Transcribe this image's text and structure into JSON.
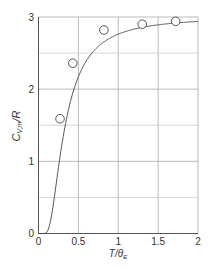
{
  "chart_data": {
    "type": "line",
    "title": "",
    "xlabel": "T/θE",
    "ylabel": "C_{V,m}/R",
    "xlim": [
      0,
      2
    ],
    "ylim": [
      0,
      3
    ],
    "x_ticks": [
      0,
      0.5,
      1,
      1.5,
      2
    ],
    "x_tick_labels": [
      "0",
      "0.5",
      "1",
      "1.5",
      "2"
    ],
    "y_ticks": [
      0,
      1,
      2,
      3
    ],
    "y_tick_labels": [
      "0",
      "1",
      "2",
      "3"
    ],
    "grid": {
      "x_step": 0.5,
      "y_step": 0.5,
      "on": true
    },
    "legend": null,
    "series": [
      {
        "name": "Einstein model",
        "kind": "line",
        "formula": "3*(1/x)^2*exp(1/x)/(exp(1/x)-1)^2",
        "x": [
          0.05,
          0.1,
          0.15,
          0.2,
          0.25,
          0.3,
          0.35,
          0.4,
          0.5,
          0.6,
          0.7,
          0.8,
          1.0,
          1.2,
          1.4,
          1.6,
          1.8,
          2.0
        ],
        "values": [
          0.0,
          0.014,
          0.11,
          0.34,
          0.66,
          1.0,
          1.3,
          1.56,
          1.92,
          2.15,
          2.34,
          2.46,
          2.76,
          2.84,
          2.88,
          2.91,
          2.93,
          2.94
        ]
      },
      {
        "name": "Experimental data",
        "kind": "scatter",
        "marker": "open-circle",
        "x": [
          0.27,
          0.43,
          0.82,
          1.3,
          1.72
        ],
        "values": [
          1.59,
          2.36,
          2.82,
          2.9,
          2.94
        ]
      }
    ]
  },
  "colors": {
    "axis": "#555555",
    "grid": "#cccccc",
    "curve": "#444444",
    "marker": "#444444",
    "text": "#333333"
  }
}
